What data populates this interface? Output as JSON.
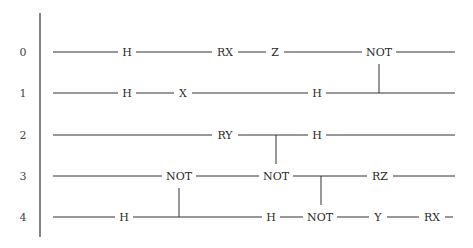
{
  "diagram": {
    "type": "quantum-circuit",
    "qubits": [
      {
        "label": "0",
        "y": 52
      },
      {
        "label": "1",
        "y": 93
      },
      {
        "label": "2",
        "y": 135
      },
      {
        "label": "3",
        "y": 176
      },
      {
        "label": "4",
        "y": 217
      }
    ],
    "wire_start_x": 53,
    "wire_end_x": 455,
    "label_x": 23,
    "axis": {
      "x": 40,
      "y1": 13,
      "y2": 237
    },
    "gates": [
      {
        "qubit": 0,
        "label": "H",
        "x": 127
      },
      {
        "qubit": 0,
        "label": "RX",
        "x": 225
      },
      {
        "qubit": 0,
        "label": "Z",
        "x": 275
      },
      {
        "qubit": 0,
        "label": "NOT",
        "x": 379
      },
      {
        "qubit": 1,
        "label": "H",
        "x": 127
      },
      {
        "qubit": 1,
        "label": "X",
        "x": 183
      },
      {
        "qubit": 1,
        "label": "H",
        "x": 317
      },
      {
        "qubit": 2,
        "label": "RY",
        "x": 225
      },
      {
        "qubit": 2,
        "label": "H",
        "x": 317
      },
      {
        "qubit": 3,
        "label": "NOT",
        "x": 179
      },
      {
        "qubit": 3,
        "label": "NOT",
        "x": 276
      },
      {
        "qubit": 3,
        "label": "RZ",
        "x": 380
      },
      {
        "qubit": 4,
        "label": "H",
        "x": 124
      },
      {
        "qubit": 4,
        "label": "H",
        "x": 271
      },
      {
        "qubit": 4,
        "label": "NOT",
        "x": 320
      },
      {
        "qubit": 4,
        "label": "Y",
        "x": 378
      },
      {
        "qubit": 4,
        "label": "RX",
        "x": 432
      }
    ],
    "controls": [
      {
        "x": 379,
        "from_qubit": 1,
        "to_qubit": 0,
        "target_label": "NOT"
      },
      {
        "x": 179,
        "from_qubit": 4,
        "to_qubit": 3,
        "target_label": "NOT"
      },
      {
        "x": 276,
        "from_qubit": 2,
        "to_qubit": 3,
        "target_label": "NOT"
      },
      {
        "x": 321,
        "from_qubit": 3,
        "to_qubit": 4,
        "target_label": "NOT"
      }
    ],
    "row4_end_x": 453
  }
}
